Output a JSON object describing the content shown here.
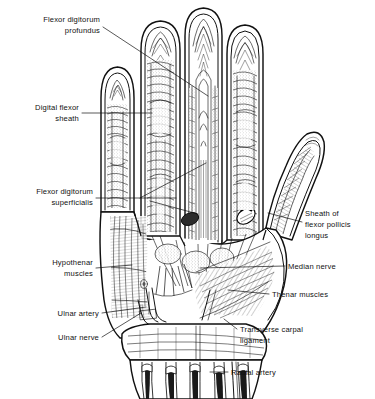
{
  "figure": {
    "name": "palmar-hand-dissection",
    "background_color": "#ffffff",
    "ink_color": "#111111",
    "width": 375,
    "height": 399,
    "view": "palmar (anterior) view of right hand, skin and palmar fascia removed"
  },
  "labels": [
    {
      "id": "flexor-digitorum-profundus",
      "lines": [
        "Flexor digitorum",
        "profundus"
      ],
      "line1": "Flexor digitorum",
      "line2": "profundus",
      "align": "right",
      "text_x": 100,
      "text_y": 22,
      "leader": "from text right edge down-right to middle finger tendon"
    },
    {
      "id": "digital-flexor-sheath",
      "lines": [
        "Digital flexor",
        "sheath"
      ],
      "line1": "Digital flexor",
      "line2": "sheath",
      "align": "right",
      "text_x": 79,
      "text_y": 108,
      "leader": "horizontal right to ring-finger sheath"
    },
    {
      "id": "flexor-digitorum-superficialis",
      "lines": [
        "Flexor digitorum",
        "superficialis"
      ],
      "line1": "Flexor digitorum",
      "line2": "superficialis",
      "align": "right",
      "text_x": 93,
      "text_y": 192,
      "leader": "two branches rising right into palm tendons"
    },
    {
      "id": "hypothenar-muscles",
      "lines": [
        "Hypothenar",
        "muscles"
      ],
      "line1": "Hypothenar",
      "line2": "muscles",
      "align": "right",
      "text_x": 93,
      "text_y": 262,
      "leader": "horizontal right to ulnar border muscle mass"
    },
    {
      "id": "ulnar-artery",
      "lines": [
        "Ulnar artery"
      ],
      "line1": "Ulnar artery",
      "align": "right",
      "text_x": 99,
      "text_y": 313,
      "leader": "horizontal right to vessel at wrist"
    },
    {
      "id": "ulnar-nerve",
      "lines": [
        "Ulnar nerve"
      ],
      "line1": "Ulnar nerve",
      "align": "right",
      "text_x": 99,
      "text_y": 340,
      "leader": "up-right to nerve beside ulnar artery"
    },
    {
      "id": "sheath-of-flexor-pollicis-longus",
      "lines": [
        "Sheath of",
        "flexor pollicis",
        "longus"
      ],
      "line1": "Sheath of",
      "line2": "flexor pollicis",
      "line3": "longus",
      "align": "left",
      "text_x": 305,
      "text_y": 219,
      "leader": "left to thumb tendon sheath"
    },
    {
      "id": "median-nerve",
      "lines": [
        "Median nerve"
      ],
      "line1": "Median nerve",
      "align": "left",
      "text_x": 288,
      "text_y": 269,
      "leader": "long horizontal left into mid palm"
    },
    {
      "id": "thenar-muscles",
      "lines": [
        "Thenar muscles"
      ],
      "line1": "Thenar muscles",
      "align": "left",
      "text_x": 272,
      "text_y": 297,
      "leader": "horizontal left into thenar eminence"
    },
    {
      "id": "transverse-carpal-ligament",
      "lines": [
        "Transverse carpal",
        "ligament"
      ],
      "line1": "Transverse carpal",
      "line2": "ligament",
      "align": "left",
      "text_x": 240,
      "text_y": 332,
      "leader": "up-left to flexor retinaculum at wrist"
    },
    {
      "id": "radial-artery",
      "lines": [
        "Radial artery"
      ],
      "line1": "Radial artery",
      "align": "left",
      "text_x": 231,
      "text_y": 372,
      "leader": "horizontal left to vessel in forearm"
    }
  ]
}
